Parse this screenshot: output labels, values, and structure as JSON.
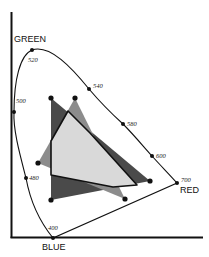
{
  "diagram": {
    "type": "chromaticity-gamut-diagram",
    "axis_labels": {
      "green": "GREEN",
      "red": "RED",
      "blue": "BLUE"
    },
    "wavelength_labels": {
      "w520": "520",
      "w540": "540",
      "w580": "580",
      "w600": "600",
      "w700": "700",
      "w500": "500",
      "w480": "480",
      "w400": "400"
    },
    "colors": {
      "dark_gamut": "#4a4a4a",
      "medium_gamut": "#8c8c8c",
      "intersection": "#d9d9d9",
      "lines": "#111111"
    },
    "gamuts": [
      {
        "name": "dark-triangle",
        "vertices": [
          [
            51,
            98
          ],
          [
            150,
            181
          ],
          [
            51,
            200
          ]
        ]
      },
      {
        "name": "medium-triangle",
        "vertices": [
          [
            75,
            98
          ],
          [
            38,
            163
          ],
          [
            125,
            199
          ]
        ]
      }
    ]
  }
}
